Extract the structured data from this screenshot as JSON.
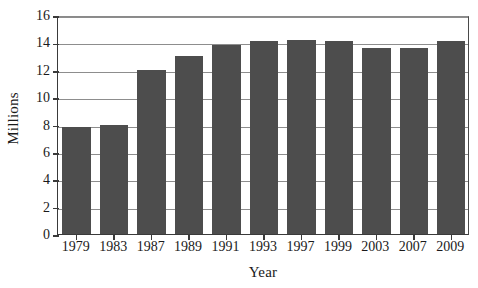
{
  "chart_data": {
    "type": "bar",
    "title": "",
    "subtitle": "",
    "xlabel": "Year",
    "ylabel": "Millions",
    "categories": [
      "1979",
      "1983",
      "1987",
      "1989",
      "1991",
      "1993",
      "1997",
      "1999",
      "2003",
      "2007",
      "2009"
    ],
    "values": [
      7.8,
      8.0,
      12.0,
      13.0,
      13.8,
      14.1,
      14.2,
      14.1,
      13.6,
      13.6,
      14.1
    ],
    "series": [
      {
        "name": "Millions",
        "values": [
          7.8,
          8.0,
          12.0,
          13.0,
          13.8,
          14.1,
          14.2,
          14.1,
          13.6,
          13.6,
          14.1
        ]
      }
    ],
    "ylim": [
      0,
      16
    ],
    "yticks": [
      0,
      2,
      4,
      6,
      8,
      10,
      12,
      14,
      16
    ],
    "ytick_labels": [
      "0",
      "2",
      "4",
      "6",
      "8",
      "10",
      "12",
      "14",
      "16"
    ],
    "grid": "horizontal",
    "legend": "none",
    "bar_color": "#4d4d4d",
    "axis_color": "#3a3a3a",
    "gridline_color": "#8d8d8d",
    "background_color": "#ffffff"
  }
}
